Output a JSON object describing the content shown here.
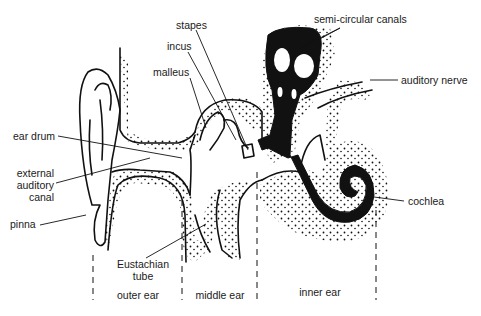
{
  "diagram": {
    "labels": {
      "stapes": "stapes",
      "incus": "incus",
      "malleus": "malleus",
      "semicircular_canals": "semi-circular canals",
      "auditory_nerve": "auditory nerve",
      "ear_drum": "ear drum",
      "external_auditory_canal_1": "external",
      "external_auditory_canal_2": "auditory",
      "external_auditory_canal_3": "canal",
      "pinna": "pinna",
      "cochlea": "cochlea",
      "eustachian_tube_1": "Eustachian",
      "eustachian_tube_2": "tube"
    },
    "regions": {
      "outer_ear": "outer ear",
      "middle_ear": "middle ear",
      "inner_ear": "inner ear"
    },
    "colors": {
      "ink": "#111111",
      "background": "#ffffff"
    }
  }
}
